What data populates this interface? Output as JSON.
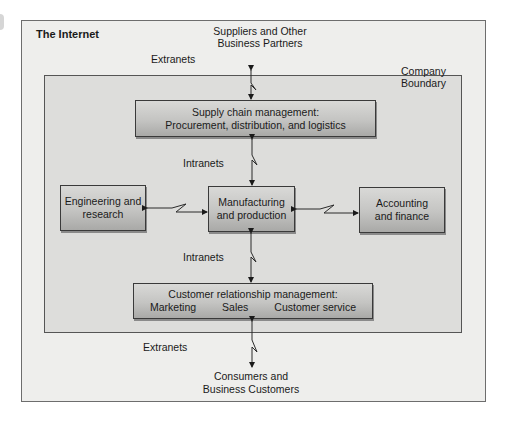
{
  "diagram": {
    "outer_region": {
      "label": "The Internet"
    },
    "company_region": {
      "label_line1": "Company",
      "label_line2": "Boundary"
    },
    "external_parties": {
      "suppliers": {
        "line1": "Suppliers and Other",
        "line2": "Business Partners"
      },
      "customers": {
        "line1": "Consumers and",
        "line2": "Business Customers"
      }
    },
    "nodes": {
      "supply_chain": {
        "line1": "Supply chain management:",
        "line2": "Procurement, distribution, and logistics"
      },
      "engineering": {
        "line1": "Engineering and",
        "line2": "research"
      },
      "manufacturing": {
        "line1": "Manufacturing",
        "line2": "and production"
      },
      "accounting": {
        "line1": "Accounting",
        "line2": "and finance"
      },
      "crm": {
        "line1": "Customer relationship management:",
        "items": [
          "Marketing",
          "Sales",
          "Customer service"
        ]
      }
    },
    "link_labels": {
      "extranets_top": "Extranets",
      "intranets_top": "Intranets",
      "intranets_bottom": "Intranets",
      "extranets_bottom": "Extranets"
    },
    "edges": [
      {
        "from": "Suppliers and Other Business Partners",
        "to": "Supply chain management",
        "type": "Extranets",
        "bidirectional": true
      },
      {
        "from": "Supply chain management",
        "to": "Manufacturing and production",
        "type": "Intranets",
        "bidirectional": true
      },
      {
        "from": "Engineering and research",
        "to": "Manufacturing and production",
        "bidirectional": true
      },
      {
        "from": "Manufacturing and production",
        "to": "Accounting and finance",
        "bidirectional": true
      },
      {
        "from": "Manufacturing and production",
        "to": "Customer relationship management",
        "type": "Intranets",
        "bidirectional": true
      },
      {
        "from": "Customer relationship management",
        "to": "Consumers and Business Customers",
        "type": "Extranets",
        "bidirectional": true
      }
    ],
    "colors": {
      "outer_fill": "#eeeeec",
      "company_fill": "#dddddb",
      "box_top": "#d9d9d7",
      "box_bottom": "#a9a9a7",
      "line": "#2a2a2a"
    }
  }
}
